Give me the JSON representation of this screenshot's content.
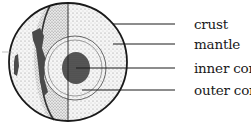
{
  "diagram": {
    "labels": [
      {
        "id": "crust",
        "text": "crust",
        "y": 24
      },
      {
        "id": "mantle",
        "text": "mantle",
        "y": 44
      },
      {
        "id": "inner-core",
        "text": "inner core",
        "y": 68
      },
      {
        "id": "outer-core",
        "text": "outer core",
        "y": 90
      }
    ],
    "colors": {
      "outline": "#1a1a1a",
      "stipple": "#d8d8d8",
      "inner_core": "#555555",
      "crust_dark": "#4a4a4a"
    }
  }
}
